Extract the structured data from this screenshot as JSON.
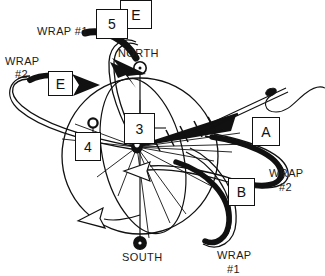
{
  "figure": {
    "background_color": "#ffffff",
    "ink_color": "#111111"
  },
  "poles": {
    "north": {
      "label": "NORTH",
      "marker": "open-circle-with-dot"
    },
    "south": {
      "label": "SOUTH",
      "marker": "filled-circle"
    }
  },
  "wrap_labels": {
    "top_left": "WRAP #1",
    "left_line1": "WRAP",
    "left_line2": "#2",
    "right_line1": "WRAP",
    "right_line2": "#2",
    "bottom_line1": "WRAP",
    "bottom_line2": "#1"
  },
  "callouts": [
    {
      "id": "e-top",
      "label": "E",
      "name": "callout-box-e-top"
    },
    {
      "id": "five",
      "label": "5",
      "name": "callout-box-5"
    },
    {
      "id": "e-left",
      "label": "E",
      "name": "callout-box-e-left"
    },
    {
      "id": "three",
      "label": "3",
      "name": "callout-box-3"
    },
    {
      "id": "four",
      "label": "4",
      "name": "callout-box-4"
    },
    {
      "id": "a",
      "label": "A",
      "name": "callout-box-a"
    },
    {
      "id": "b",
      "label": "B",
      "name": "callout-box-b"
    }
  ]
}
